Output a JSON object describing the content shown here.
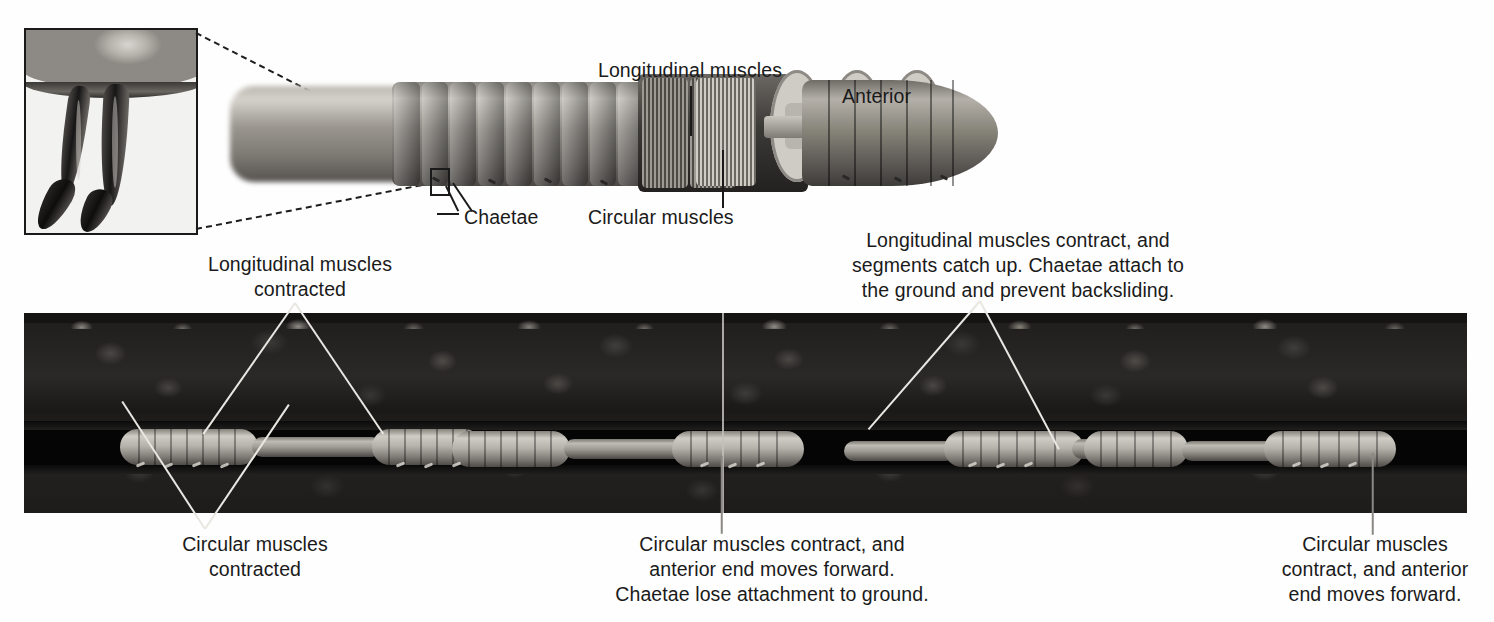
{
  "figure": {
    "background_color": "#ffffff"
  },
  "top_diagram": {
    "labels": {
      "longitudinal_muscles": "Longitudinal muscles",
      "anterior": "Anterior",
      "chaetae": "Chaetae",
      "circular_muscles": "Circular muscles"
    },
    "inset": {
      "name": "chaetae-closeup-inset",
      "depicts": "two chaetae (bristles) projecting from the body wall"
    }
  },
  "bottom_panel": {
    "photo": "earthworm moving through a soil burrow, cutaway side view",
    "callouts": {
      "longitudinal_contracted": "Longitudinal muscles\ncontracted",
      "circular_contracted": "Circular muscles\ncontracted",
      "longitudinal_contract_catchup": "Longitudinal muscles contract, and\nsegments catch up. Chaetae attach to\nthe ground and prevent backsliding.",
      "circular_contract_center": "Circular muscles contract, and\nanterior end moves forward.\nChaetae lose attachment to ground.",
      "circular_contract_right": "Circular muscles\ncontract, and anterior\nend moves forward."
    }
  },
  "colors": {
    "text": "#1a1a1a",
    "soil_dark": "#211f1e",
    "burrow_black": "#050505",
    "worm_pale": "#cfccc5",
    "leader_light": "#e9e7e2"
  }
}
